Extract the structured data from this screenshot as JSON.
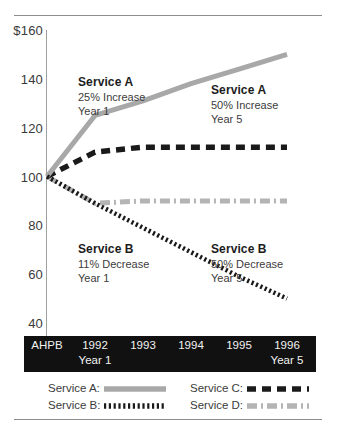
{
  "chart_data": {
    "type": "line",
    "title": "",
    "xlabel": "",
    "ylabel": "",
    "x": [
      "AHPB",
      "1992",
      "1993",
      "1994",
      "1995",
      "1996"
    ],
    "xtick_sublabels": [
      "",
      "Year 1",
      "",
      "",
      "",
      "Year 5"
    ],
    "ylim": [
      40,
      160
    ],
    "yticks": [
      160,
      140,
      120,
      100,
      80,
      60,
      40
    ],
    "ytick_labels": [
      "$160",
      "140",
      "120",
      "100",
      "80",
      "60",
      "40"
    ],
    "grid": false,
    "legend_position": "bottom",
    "series": [
      {
        "name": "Service A",
        "values": [
          100,
          125,
          131,
          138,
          144,
          150
        ],
        "style": "solid",
        "color": "#a8a8a8"
      },
      {
        "name": "Service B",
        "values": [
          100,
          89,
          79,
          69,
          59,
          50
        ],
        "style": "dotted",
        "color": "#1a1a1a"
      },
      {
        "name": "Service C",
        "values": [
          100,
          110,
          112,
          112,
          112,
          112
        ],
        "style": "dashed",
        "color": "#1a1a1a"
      },
      {
        "name": "Service D",
        "values": [
          100,
          89,
          90,
          90,
          90,
          90
        ],
        "style": "dashdot",
        "color": "#b4b4b4"
      }
    ],
    "annotations": [
      {
        "title": "Service A",
        "line1": "25% Increase",
        "line2": "Year 1"
      },
      {
        "title": "Service A",
        "line1": "50% Increase",
        "line2": "Year 5"
      },
      {
        "title": "Service B",
        "line1": "11% Decrease",
        "line2": "Year 1"
      },
      {
        "title": "Service B",
        "line1": "50% Decrease",
        "line2": "Year 5"
      }
    ]
  },
  "yaxis": {
    "t0": "$160",
    "t1": "140",
    "t2": "120",
    "t3": "100",
    "t4": "80",
    "t5": "60",
    "t6": "40"
  },
  "xaxis": {
    "labels": [
      "AHPB",
      "1992",
      "1993",
      "1994",
      "1995",
      "1996"
    ],
    "sub": {
      "year1": "Year 1",
      "year5": "Year 5"
    }
  },
  "legend": {
    "items": [
      {
        "label": "Service A:",
        "style": "solid",
        "color": "#a8a8a8"
      },
      {
        "label": "Service B:",
        "style": "dotted",
        "color": "#1a1a1a"
      },
      {
        "label": "Service C:",
        "style": "dashed",
        "color": "#1a1a1a"
      },
      {
        "label": "Service D:",
        "style": "dashdot",
        "color": "#b4b4b4"
      }
    ]
  },
  "colors": {
    "service_a": "#a8a8a8",
    "service_b": "#1a1a1a",
    "service_c": "#1a1a1a",
    "service_d": "#b4b4b4",
    "axis": "#a0a0a0",
    "band": "#111111",
    "rule": "#8e8e8e"
  }
}
